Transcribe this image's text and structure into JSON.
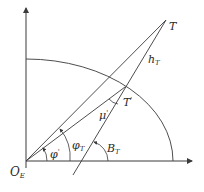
{
  "diagram": {
    "labels": {
      "T": "T",
      "h_T_main": "h",
      "h_T_sub": "T",
      "T_prime_main": "T",
      "T_prime_mark": "'",
      "mu_prime_main": "μ",
      "mu_prime_mark": "'",
      "phi_T_main": "φ",
      "phi_T_sub": "T",
      "B_T_main": "B",
      "B_T_sub": "T",
      "phi_prime_main": "φ",
      "phi_prime_mark": "'",
      "O_E_main": "O",
      "O_E_sub": "E"
    },
    "points": {
      "origin": [
        26,
        161
      ],
      "T": [
        166,
        20
      ],
      "T_prime": [
        125,
        87
      ],
      "line_bottom": [
        73,
        175
      ]
    },
    "stroke_color": "#3a3a3a"
  }
}
